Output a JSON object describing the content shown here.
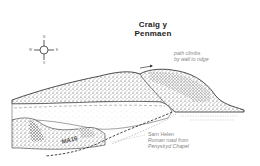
{
  "title": {
    "line1": "Craig y",
    "line2": "Penmaen"
  },
  "compass": {
    "north": "N",
    "south": "S",
    "east": "E",
    "west": "W",
    "icon": "compass-rose-icon"
  },
  "annotations": {
    "path_note": {
      "line1": "path climbs",
      "line2": "by wall to ridge"
    },
    "road_note": {
      "line1": "Sarn Helen",
      "line2": "Roman road from",
      "line3": "Penystryd Chapel"
    }
  },
  "road_label": "MA16",
  "colors": {
    "ink": "#222222",
    "note_text": "#888888",
    "background": "#ffffff"
  }
}
